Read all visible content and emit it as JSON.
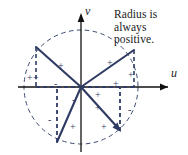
{
  "figure": {
    "type": "math-diagram",
    "caption": {
      "lines": [
        "Radius is",
        "always",
        "positive."
      ]
    },
    "axes": {
      "horizontal_label": "u",
      "vertical_label": "v",
      "origin": {
        "x": 81,
        "y": 87
      },
      "x_range": [
        18,
        170
      ],
      "y_range": [
        14,
        152
      ]
    },
    "circle": {
      "center": {
        "x": 81,
        "y": 87
      },
      "radius": 57,
      "style": "dashed",
      "color": "#3c4a72"
    },
    "colors": {
      "vector": "#2f3b63",
      "axis": "#111111",
      "dashed": "#3c4a72",
      "text": "#1a1a1a",
      "background": "#ffffff"
    },
    "vectors": [
      {
        "name": "vector-quadrant-2",
        "quadrant": 2,
        "tip": {
          "x": 36,
          "y": 47
        },
        "u_sign": "-",
        "v_sign": "+",
        "arrowhead": false
      },
      {
        "name": "vector-quadrant-1",
        "quadrant": 1,
        "tip": {
          "x": 134,
          "y": 50
        },
        "u_sign": "+",
        "v_sign": "+",
        "arrowhead": false
      },
      {
        "name": "vector-quadrant-3",
        "quadrant": 3,
        "tip": {
          "x": 57,
          "y": 142
        },
        "u_sign": "-",
        "v_sign": "-",
        "arrowhead": false
      },
      {
        "name": "vector-quadrant-4",
        "quadrant": 4,
        "tip": {
          "x": 120,
          "y": 131
        },
        "u_sign": "+",
        "v_sign": "-",
        "arrowhead": true
      }
    ],
    "signs": [
      {
        "name": "sign-q2-radius-a",
        "text": "+",
        "x": 27,
        "y": 73
      },
      {
        "name": "sign-q2-radius-b",
        "text": "+",
        "x": 33,
        "y": 73
      },
      {
        "name": "sign-q2-v-component",
        "text": "+",
        "x": 58,
        "y": 61
      },
      {
        "name": "sign-q2-u-component",
        "text": "-",
        "x": 54,
        "y": 79
      },
      {
        "name": "sign-q1-v-component",
        "text": "+",
        "x": 107,
        "y": 58
      },
      {
        "name": "sign-q1-radius",
        "text": "+",
        "x": 128,
        "y": 70
      },
      {
        "name": "sign-q1-u-component",
        "text": "+",
        "x": 113,
        "y": 79
      },
      {
        "name": "sign-q1-axis-tick",
        "text": "+",
        "x": 95,
        "y": 90
      },
      {
        "name": "sign-q3-v-component",
        "text": "-",
        "x": 72,
        "y": 95
      },
      {
        "name": "sign-q3-u-component",
        "text": "-",
        "x": 48,
        "y": 115
      },
      {
        "name": "sign-q3-radius",
        "text": "+",
        "x": 70,
        "y": 122
      },
      {
        "name": "sign-q4-u-component",
        "text": "+",
        "x": 95,
        "y": 103
      },
      {
        "name": "sign-q4-radius",
        "text": "+",
        "x": 101,
        "y": 122
      },
      {
        "name": "sign-q4-v-component",
        "text": "-",
        "x": 128,
        "y": 105
      }
    ]
  }
}
